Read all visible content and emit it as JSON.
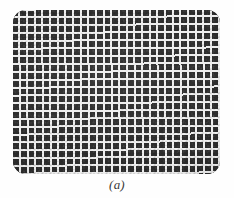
{
  "figure": {
    "caption": "(a)",
    "panel": {
      "shape": "rounded-rectangle",
      "grid_columns": 27,
      "grid_rows": 21,
      "cell_color": "#2d2d2d",
      "line_color": "#eeeeee",
      "background_color": "#fefefe",
      "corner_radius_px": 13
    },
    "alt_description": "Grayscale micrograph of a rounded rectangular panel filled with a dense regular array of dark square cells separated by light grid lines."
  },
  "chart_data": {
    "type": "heatmap",
    "title": "(a)",
    "xlabel": "",
    "ylabel": "",
    "grid": true,
    "legend": "none",
    "columns": 27,
    "rows": 21,
    "value_range": [
      0,
      1
    ],
    "uniform_value": 0.18,
    "note": "Uniform dark square array; all cells share the same nominal value, modulated only by photographic grain and vignetting.",
    "colors": {
      "cell": "#2d2d2d",
      "separator": "#eeeeee",
      "background": "#fefefe",
      "caption_text": "#3a3a3a"
    }
  }
}
